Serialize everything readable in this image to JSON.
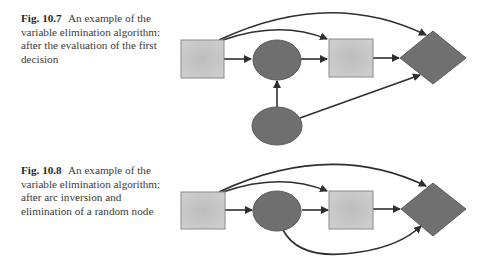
{
  "figures": [
    {
      "label": "Fig. 10.7",
      "caption": "An example of the variable elimination algorithm: after the evaluation of the first decision",
      "nodes": [
        {
          "id": "decision-1",
          "shape": "square"
        },
        {
          "id": "random-1",
          "shape": "ellipse"
        },
        {
          "id": "decision-2",
          "shape": "square"
        },
        {
          "id": "utility",
          "shape": "diamond"
        },
        {
          "id": "random-2",
          "shape": "ellipse"
        }
      ],
      "arcs": [
        [
          "decision-1",
          "random-1"
        ],
        [
          "random-1",
          "decision-2"
        ],
        [
          "decision-2",
          "utility"
        ],
        [
          "decision-1",
          "decision-2"
        ],
        [
          "decision-1",
          "utility"
        ],
        [
          "random-2",
          "random-1"
        ],
        [
          "random-2",
          "utility"
        ]
      ]
    },
    {
      "label": "Fig. 10.8",
      "caption": "An example of the variable elimination algorithm: after arc inversion and elimination of a random node",
      "nodes": [
        {
          "id": "decision-1",
          "shape": "square"
        },
        {
          "id": "random-1",
          "shape": "ellipse"
        },
        {
          "id": "decision-2",
          "shape": "square"
        },
        {
          "id": "utility",
          "shape": "diamond"
        }
      ],
      "arcs": [
        [
          "decision-1",
          "random-1"
        ],
        [
          "random-1",
          "decision-2"
        ],
        [
          "decision-2",
          "utility"
        ],
        [
          "decision-1",
          "decision-2"
        ],
        [
          "decision-1",
          "utility"
        ],
        [
          "random-1",
          "utility"
        ]
      ]
    }
  ],
  "colors": {
    "square_fill": "#c9c9c9",
    "square_border": "#8a8a8a",
    "dark_node": "#6f6f6f",
    "arc": "#2e2e2e"
  }
}
